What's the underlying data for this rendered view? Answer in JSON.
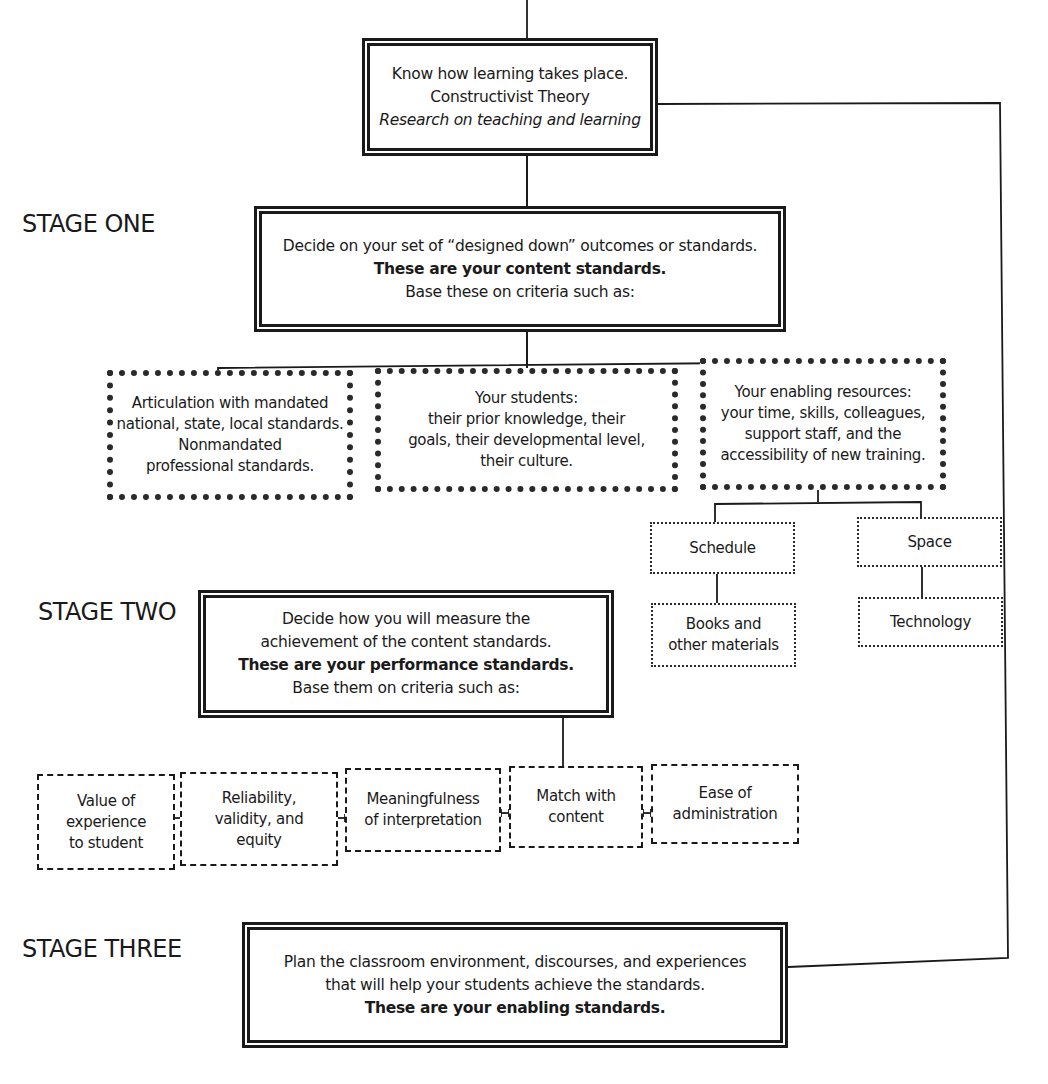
{
  "stages": {
    "one": "STAGE ONE",
    "two": "STAGE TWO",
    "three": "STAGE THREE"
  },
  "top_box": {
    "line1": "Know how learning takes place.",
    "line2": "Constructivist Theory",
    "line3": "Research on teaching and learning"
  },
  "stage_one_box": {
    "line1": "Decide on your set of “designed down” outcomes or standards.",
    "line2": "These are your content standards.",
    "line3": "Base these on criteria such as:"
  },
  "criteria_one": [
    {
      "lines": [
        "Articulation with mandated",
        "national, state, local standards.",
        "Nonmandated",
        "professional standards."
      ]
    },
    {
      "lines": [
        "Your students:",
        "their prior knowledge, their",
        "goals, their developmental level,",
        "their culture."
      ]
    },
    {
      "lines": [
        "Your enabling resources:",
        "your time, skills, colleagues,",
        "support staff, and the",
        "accessibility of new training."
      ]
    }
  ],
  "resources": {
    "schedule": "Schedule",
    "space": "Space",
    "books": [
      "Books and",
      "other materials"
    ],
    "technology": "Technology"
  },
  "stage_two_box": {
    "line1": "Decide how you will measure the",
    "line2": "achievement of the content standards.",
    "line3": "These are your performance standards.",
    "line4": "Base them on criteria such as:"
  },
  "criteria_two": [
    {
      "lines": [
        "Value of",
        "experience",
        "to student"
      ]
    },
    {
      "lines": [
        "Reliability,",
        "validity, and",
        "equity"
      ]
    },
    {
      "lines": [
        "Meaningfulness",
        "of interpretation"
      ]
    },
    {
      "lines": [
        "Match with",
        "content"
      ]
    },
    {
      "lines": [
        "Ease of",
        "administration"
      ]
    }
  ],
  "stage_three_box": {
    "line1": "Plan the classroom environment, discourses, and experiences",
    "line2": "that will help your students achieve the standards.",
    "line3": "These are your enabling standards."
  }
}
